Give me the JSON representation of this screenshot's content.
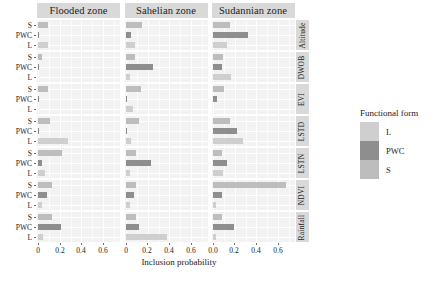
{
  "chart_data": {
    "type": "bar",
    "title": "",
    "xlabel": "Inclusion probability",
    "ylabel": "",
    "xlim": [
      0,
      0.7
    ],
    "xticks": [
      0,
      0.2,
      0.4,
      0.6
    ],
    "xticklabels_panel1": [
      "0",
      "0.2",
      "0.4",
      "0.6"
    ],
    "xticklabels_panel2": [
      "0",
      "0.2",
      "0.4",
      "0.6"
    ],
    "xticklabels_panel3": [
      "0.0",
      "0.2",
      "0.4",
      "0.6"
    ],
    "grid": true,
    "legend_position": "right",
    "orientation": "horizontal",
    "facet_columns": [
      "Flooded zone",
      "Sahelian zone",
      "Sudannian zone"
    ],
    "facet_rows": [
      "Altitude",
      "DWOB",
      "EVI",
      "LSTD",
      "LSTN",
      "NDVI",
      "Rainfall"
    ],
    "categories": [
      "S",
      "PWC",
      "L"
    ],
    "legend": {
      "title": "Functional form",
      "entries": [
        {
          "label": "L",
          "color": "#cfcfcf"
        },
        {
          "label": "PWC",
          "color": "#8e8e8e"
        },
        {
          "label": "S",
          "color": "#bdbdbd"
        }
      ]
    },
    "panels": [
      {
        "row": "Altitude",
        "cells": [
          {
            "zone": "Flooded zone",
            "values": {
              "S": 0.09,
              "PWC": 0.005,
              "L": 0.09
            }
          },
          {
            "zone": "Sahelian zone",
            "values": {
              "S": 0.155,
              "PWC": 0.055,
              "L": 0.085
            }
          },
          {
            "zone": "Sudannian zone",
            "values": {
              "S": 0.16,
              "PWC": 0.33,
              "L": 0.13
            }
          }
        ]
      },
      {
        "row": "DWOB",
        "cells": [
          {
            "zone": "Flooded zone",
            "values": {
              "S": 0.035,
              "PWC": 0.012,
              "L": 0.0
            }
          },
          {
            "zone": "Sahelian zone",
            "values": {
              "S": 0.085,
              "PWC": 0.25,
              "L": 0.045
            }
          },
          {
            "zone": "Sudannian zone",
            "values": {
              "S": 0.095,
              "PWC": 0.085,
              "L": 0.17
            }
          }
        ]
      },
      {
        "row": "EVI",
        "cells": [
          {
            "zone": "Flooded zone",
            "values": {
              "S": 0.09,
              "PWC": 0.006,
              "L": 0.0
            }
          },
          {
            "zone": "Sahelian zone",
            "values": {
              "S": 0.14,
              "PWC": 0.012,
              "L": 0.07
            }
          },
          {
            "zone": "Sudannian zone",
            "values": {
              "S": 0.105,
              "PWC": 0.04,
              "L": 0.0
            }
          }
        ]
      },
      {
        "row": "LSTD",
        "cells": [
          {
            "zone": "Flooded zone",
            "values": {
              "S": 0.115,
              "PWC": 0.01,
              "L": 0.28
            }
          },
          {
            "zone": "Sahelian zone",
            "values": {
              "S": 0.125,
              "PWC": 0.012,
              "L": 0.055
            }
          },
          {
            "zone": "Sudannian zone",
            "values": {
              "S": 0.16,
              "PWC": 0.225,
              "L": 0.285
            }
          }
        ]
      },
      {
        "row": "LSTN",
        "cells": [
          {
            "zone": "Flooded zone",
            "values": {
              "S": 0.225,
              "PWC": 0.035,
              "L": 0.06
            }
          },
          {
            "zone": "Sahelian zone",
            "values": {
              "S": 0.1,
              "PWC": 0.235,
              "L": 0.04
            }
          },
          {
            "zone": "Sudannian zone",
            "values": {
              "S": 0.09,
              "PWC": 0.13,
              "L": 0.1
            }
          }
        ]
      },
      {
        "row": "NDVI",
        "cells": [
          {
            "zone": "Flooded zone",
            "values": {
              "S": 0.125,
              "PWC": 0.085,
              "L": 0.035
            }
          },
          {
            "zone": "Sahelian zone",
            "values": {
              "S": 0.095,
              "PWC": 0.075,
              "L": 0.04
            }
          },
          {
            "zone": "Sudannian zone",
            "values": {
              "S": 0.675,
              "PWC": 0.085,
              "L": 0.03
            }
          }
        ]
      },
      {
        "row": "Rainfall",
        "cells": [
          {
            "zone": "Flooded zone",
            "values": {
              "S": 0.125,
              "PWC": 0.215,
              "L": 0.05
            }
          },
          {
            "zone": "Sahelian zone",
            "values": {
              "S": 0.1,
              "PWC": 0.125,
              "L": 0.38
            }
          },
          {
            "zone": "Sudannian zone",
            "values": {
              "S": 0.09,
              "PWC": 0.2,
              "L": 0.03
            }
          }
        ]
      }
    ]
  }
}
